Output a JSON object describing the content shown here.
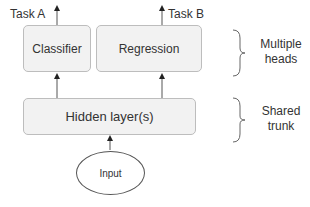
{
  "diagram": {
    "outputs": {
      "task_a": "Task A",
      "task_b": "Task B"
    },
    "heads": {
      "classifier": "Classifier",
      "regression": "Regression"
    },
    "trunk": {
      "hidden": "Hidden layer(s)"
    },
    "input": "Input",
    "annotations": {
      "heads_line1": "Multiple",
      "heads_line2": "heads",
      "trunk_line1": "Shared",
      "trunk_line2": "trunk"
    }
  }
}
